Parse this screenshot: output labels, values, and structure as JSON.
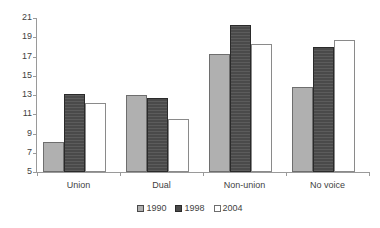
{
  "chart_data": {
    "type": "bar",
    "title": "",
    "subtitle": "",
    "xlabel": "",
    "ylabel": "",
    "categories": [
      "Union",
      "Dual",
      "Non-union",
      "No voice"
    ],
    "series": [
      {
        "name": "1990",
        "color": "#b0b0b0",
        "values": [
          8.1,
          13.0,
          17.3,
          13.8
        ]
      },
      {
        "name": "1998",
        "color": "#4a4a4a",
        "values": [
          13.1,
          12.7,
          20.3,
          18.0
        ]
      },
      {
        "name": "2004",
        "color": "#ffffff",
        "values": [
          12.2,
          10.5,
          18.3,
          18.7
        ]
      }
    ],
    "ylim": [
      5,
      21
    ],
    "yticks": [
      5,
      7,
      9,
      11,
      13,
      15,
      17,
      19,
      21
    ],
    "ytick_labels": [
      "5",
      "7",
      "9",
      "11",
      "13",
      "15",
      "17",
      "19",
      "21"
    ],
    "grid": false,
    "legend_position": "bottom",
    "legend_entries": [
      "1990",
      "1998",
      "2004"
    ]
  },
  "axis": {
    "y_labels": [
      "21",
      "19",
      "17",
      "15",
      "13",
      "11",
      "9",
      "7",
      "5"
    ],
    "x_labels": [
      "Union",
      "Dual",
      "Non-union",
      "No voice"
    ]
  },
  "legend": {
    "items": [
      {
        "label": "1990",
        "swatch": "swatch-gray"
      },
      {
        "label": "1998",
        "swatch": "swatch-dark"
      },
      {
        "label": "2004",
        "swatch": "swatch-white"
      }
    ]
  }
}
